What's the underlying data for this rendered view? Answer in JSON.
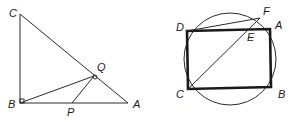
{
  "figures": [
    {
      "name": "right-triangle-figure",
      "labels": {
        "C": "C",
        "B": "B",
        "A": "A",
        "Q": "Q",
        "P": "P"
      },
      "points": {
        "C": [
          20,
          14
        ],
        "B": [
          20,
          103
        ],
        "A": [
          128,
          103
        ],
        "Q": [
          94,
          76
        ],
        "P": [
          72,
          103
        ]
      },
      "right_angles": [
        "B",
        "Q"
      ]
    },
    {
      "name": "circle-rectangle-figure",
      "labels": {
        "D": "D",
        "F": "F",
        "A": "A",
        "E": "E",
        "C": "C",
        "B": "B"
      },
      "circle": {
        "cx": 230,
        "cy": 59,
        "r": 46
      },
      "points": {
        "D": [
          187,
          31
        ],
        "A": [
          270,
          29
        ],
        "B": [
          271,
          87
        ],
        "C": [
          188,
          89
        ],
        "F": [
          260,
          18
        ],
        "E": [
          248,
          29
        ]
      }
    }
  ],
  "colors": {
    "stroke": "#1a1a1a",
    "background": "#ffffff"
  }
}
